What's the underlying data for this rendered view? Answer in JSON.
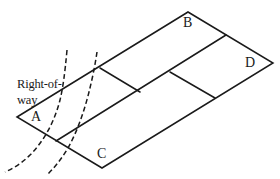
{
  "diagram": {
    "type": "parcel-subdivision-isometric",
    "stroke_color": "#1a1a1a",
    "background": "#ffffff",
    "right_of_way": {
      "label_line1": "Right-of-",
      "label_line2": "way"
    },
    "parcels": [
      {
        "id": "A",
        "label": "A"
      },
      {
        "id": "B",
        "label": "B"
      },
      {
        "id": "C",
        "label": "C"
      },
      {
        "id": "D",
        "label": "D"
      }
    ]
  }
}
